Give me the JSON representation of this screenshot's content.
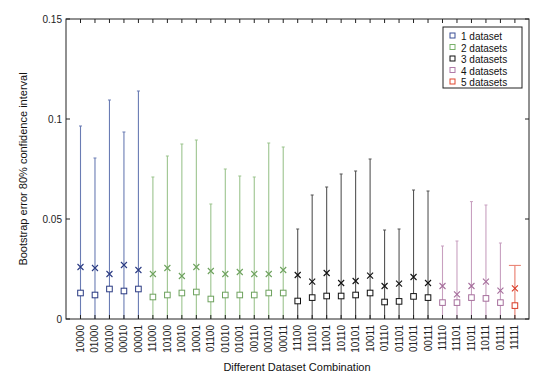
{
  "chart_data": {
    "type": "scatter",
    "subtype": "errorbar",
    "title": "",
    "xlabel": "Different Dataset Combination",
    "ylabel": "Bootstrap error 80% confidence interval",
    "ylim": [
      0,
      0.15
    ],
    "yticks": [
      0,
      0.05,
      0.1,
      0.15
    ],
    "ytick_labels": [
      "0",
      "0.05",
      "0.1",
      "0.15"
    ],
    "grid": false,
    "legend_position": "upper right",
    "categories": [
      "10000",
      "01000",
      "00100",
      "00010",
      "00001",
      "11000",
      "10100",
      "10010",
      "10001",
      "01100",
      "01010",
      "01001",
      "00110",
      "00101",
      "00011",
      "11100",
      "11010",
      "11001",
      "10110",
      "10101",
      "10011",
      "01110",
      "01101",
      "01011",
      "00111",
      "11110",
      "11101",
      "11011",
      "10111",
      "01111",
      "11111"
    ],
    "group": [
      1,
      1,
      1,
      1,
      1,
      2,
      2,
      2,
      2,
      2,
      2,
      2,
      2,
      2,
      2,
      3,
      3,
      3,
      3,
      3,
      3,
      3,
      3,
      3,
      3,
      4,
      4,
      4,
      4,
      4,
      5
    ],
    "series": [
      {
        "name": "square (lower marker)",
        "marker": "square",
        "values": [
          0.013,
          0.012,
          0.015,
          0.014,
          0.015,
          0.011,
          0.012,
          0.013,
          0.0135,
          0.01,
          0.012,
          0.012,
          0.012,
          0.013,
          0.013,
          0.009,
          0.0107,
          0.0115,
          0.0115,
          0.012,
          0.013,
          0.0085,
          0.0088,
          0.0113,
          0.0107,
          0.0082,
          0.0082,
          0.0107,
          0.0103,
          0.0082,
          0.0067
        ]
      },
      {
        "name": "x (upper marker)",
        "marker": "x",
        "values": [
          0.026,
          0.0255,
          0.0225,
          0.027,
          0.0245,
          0.0225,
          0.0255,
          0.0215,
          0.026,
          0.024,
          0.0225,
          0.0235,
          0.0225,
          0.0225,
          0.0245,
          0.022,
          0.0187,
          0.023,
          0.018,
          0.019,
          0.0217,
          0.0165,
          0.0177,
          0.021,
          0.018,
          0.0165,
          0.0123,
          0.0165,
          0.0187,
          0.0142,
          0.0153
        ]
      },
      {
        "name": "error bar upper limit",
        "values": [
          0.0965,
          0.0805,
          0.1095,
          0.0935,
          0.114,
          0.071,
          0.0815,
          0.0875,
          0.0895,
          0.0575,
          0.075,
          0.0715,
          0.071,
          0.088,
          0.086,
          0.045,
          0.062,
          0.066,
          0.0725,
          0.074,
          0.08,
          0.0445,
          0.045,
          0.0645,
          0.064,
          0.0365,
          0.039,
          0.0587,
          0.057,
          0.038,
          0.0268
        ]
      },
      {
        "name": "error bar lower limit",
        "values": [
          0,
          0,
          0,
          0,
          0,
          0,
          0,
          0,
          0,
          0,
          0,
          0,
          0,
          0,
          0,
          0,
          0,
          0,
          0,
          0,
          0,
          0,
          0,
          0,
          0,
          0,
          0,
          0,
          0,
          0,
          0
        ]
      }
    ],
    "legend": [
      {
        "label": "1 dataset",
        "color": "#3a4e96"
      },
      {
        "label": "2 datasets",
        "color": "#78b06a"
      },
      {
        "label": "3 datasets",
        "color": "#111111"
      },
      {
        "label": "4 datasets",
        "color": "#b07aa8"
      },
      {
        "label": "5 datasets",
        "color": "#e0462e"
      }
    ]
  },
  "group_colors": {
    "1": {
      "line": "#6a7cb4",
      "marker": "#2a3a82"
    },
    "2": {
      "line": "#9cc48e",
      "marker": "#6ea25e"
    },
    "3": {
      "line": "#555555",
      "marker": "#111111"
    },
    "4": {
      "line": "#c8a0c0",
      "marker": "#a66e9c"
    },
    "5": {
      "line": "#e87a6a",
      "marker": "#d83a26"
    }
  }
}
